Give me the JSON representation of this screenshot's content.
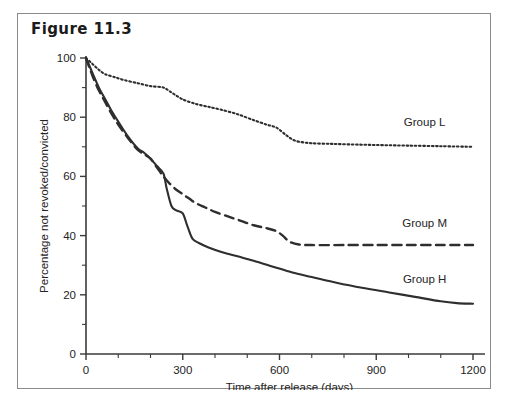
{
  "figure": {
    "title": "Figure 11.3",
    "border_color": "#8a8a8a"
  },
  "chart_data": {
    "type": "line",
    "title": "Figure 11.3",
    "xlabel": "Time after release (days)",
    "ylabel": "Percentage not revoked/convicted",
    "xlim": [
      0,
      1200
    ],
    "ylim": [
      0,
      100
    ],
    "xticks": [
      0,
      300,
      600,
      900,
      1200
    ],
    "xtick_labels": [
      "0",
      "300",
      "600",
      "900",
      "1200"
    ],
    "x_minor_step": 100,
    "yticks": [
      0,
      20,
      40,
      60,
      80,
      100
    ],
    "ytick_labels": [
      "0",
      "20",
      "40",
      "60",
      "80",
      "100"
    ],
    "y_minor_step": 10,
    "grid": false,
    "legend_position": "inline-right-of-curves",
    "line_color": "#2e2e2e",
    "series": [
      {
        "name": "Group L",
        "label": "Group L",
        "style": "dotted",
        "label_x": 1050,
        "label_y": 77,
        "x": [
          0,
          20,
          40,
          60,
          90,
          120,
          160,
          200,
          240,
          270,
          300,
          340,
          380,
          420,
          470,
          520,
          560,
          590,
          620,
          650,
          700,
          760,
          820,
          900,
          1000,
          1100,
          1200
        ],
        "y": [
          100,
          98,
          96,
          94.5,
          93.5,
          92.5,
          91.5,
          90.5,
          90,
          88,
          86,
          84.5,
          83.5,
          82.5,
          81,
          79,
          77.5,
          76.5,
          74,
          72,
          71.2,
          71,
          70.8,
          70.6,
          70.4,
          70.2,
          70
        ]
      },
      {
        "name": "Group M",
        "label": "Group M",
        "style": "dashed",
        "label_x": 1050,
        "label_y": 43,
        "x": [
          0,
          20,
          40,
          60,
          80,
          100,
          130,
          160,
          180,
          200,
          220,
          240,
          260,
          280,
          300,
          320,
          340,
          370,
          400,
          440,
          480,
          520,
          560,
          590,
          610,
          630,
          660,
          700,
          800,
          900,
          1000,
          1100,
          1200
        ],
        "y": [
          100,
          94,
          89,
          85,
          81,
          77.5,
          73,
          69,
          67.5,
          66,
          63,
          60,
          57.5,
          55.5,
          54,
          52.5,
          51,
          49.5,
          48,
          46.5,
          45,
          43.5,
          42.5,
          41.5,
          40,
          38,
          37,
          36.8,
          36.8,
          36.8,
          36.8,
          36.8,
          36.8
        ]
      },
      {
        "name": "Group H",
        "label": "Group H",
        "style": "solid",
        "label_x": 1050,
        "label_y": 24,
        "x": [
          0,
          20,
          40,
          60,
          80,
          100,
          130,
          160,
          180,
          200,
          220,
          240,
          250,
          265,
          280,
          300,
          315,
          330,
          350,
          380,
          420,
          470,
          520,
          580,
          640,
          700,
          780,
          860,
          940,
          1020,
          1100,
          1150,
          1200
        ],
        "y": [
          100,
          95,
          90,
          86,
          82,
          78.5,
          73.5,
          69.5,
          68,
          66,
          63.5,
          61,
          56,
          50,
          48.5,
          47.5,
          43,
          39,
          37.5,
          36,
          34.5,
          33,
          31.5,
          29.5,
          27.5,
          26,
          24,
          22.3,
          20.8,
          19.3,
          17.8,
          17.2,
          17
        ]
      }
    ]
  }
}
